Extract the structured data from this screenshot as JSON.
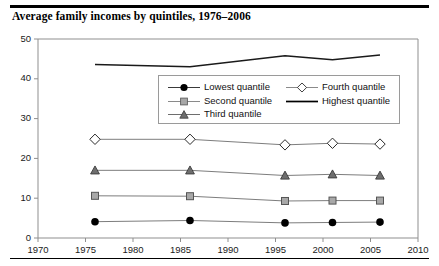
{
  "figure": {
    "title": "Average family incomes by quintiles, 1976–2006"
  },
  "chart_data": {
    "type": "line",
    "title": "Average family incomes by quintiles, 1976–2006",
    "xlabel": "",
    "ylabel": "",
    "xlim": [
      1970,
      2010
    ],
    "ylim": [
      0,
      50
    ],
    "xticks": [
      1970,
      1975,
      1980,
      1985,
      1990,
      1995,
      2000,
      2005,
      2010
    ],
    "yticks": [
      0,
      10,
      20,
      30,
      40,
      50
    ],
    "grid": false,
    "legend_position": "inside-top-center",
    "x": [
      1976,
      1986,
      1996,
      2001,
      2006
    ],
    "series": [
      {
        "name": "Lowest quantile",
        "marker": "filled-circle",
        "color": "#000000",
        "values": [
          4.1,
          4.4,
          3.8,
          3.9,
          4.0
        ]
      },
      {
        "name": "Second quantile",
        "marker": "filled-square",
        "color": "#8c8c8c",
        "values": [
          10.6,
          10.5,
          9.3,
          9.4,
          9.4
        ]
      },
      {
        "name": "Third quantile",
        "marker": "filled-triangle",
        "color": "#6e6e6e",
        "values": [
          17.0,
          17.0,
          15.7,
          16.0,
          15.7
        ]
      },
      {
        "name": "Fourth quantile",
        "marker": "open-diamond",
        "color": "#ffffff",
        "values": [
          24.8,
          24.8,
          23.4,
          23.8,
          23.6
        ]
      },
      {
        "name": "Highest quantile",
        "marker": "none",
        "color": "#000000",
        "values": [
          43.6,
          43.0,
          45.8,
          44.8,
          46.0
        ]
      }
    ]
  },
  "axes": {
    "y_tick_labels": [
      "0",
      "10",
      "20",
      "30",
      "40",
      "50"
    ],
    "x_tick_labels": [
      "1970",
      "1975",
      "1980",
      "1985",
      "1990",
      "1995",
      "2000",
      "2005",
      "2010"
    ]
  },
  "legend": {
    "column_1": [
      {
        "label": "Lowest quantile",
        "marker": "filled-circle"
      },
      {
        "label": "Second quantile",
        "marker": "filled-square"
      },
      {
        "label": "Third quantile",
        "marker": "filled-triangle"
      }
    ],
    "column_2": [
      {
        "label": "Fourth quantile",
        "marker": "open-diamond"
      },
      {
        "label": "Highest quantile",
        "marker": "none"
      }
    ]
  }
}
